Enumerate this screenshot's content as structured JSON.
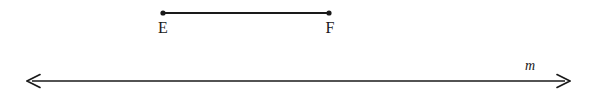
{
  "figure": {
    "background_color": "#ffffff",
    "stroke_color": "#1a1a1a",
    "width": 589,
    "height": 99
  },
  "segment": {
    "name": "segment-ef",
    "endpoint_start_label": "E",
    "endpoint_end_label": "F",
    "x1": 163,
    "x2": 329,
    "y": 13,
    "stroke_width": 2.2,
    "dot_radius": 2.6,
    "label_y": 33,
    "label_e_x": 163,
    "label_f_x": 330
  },
  "line": {
    "name": "line-m",
    "label": "m",
    "x1": 27,
    "x2": 570,
    "y": 81,
    "stroke_width": 1.5,
    "arrow_size": 9,
    "label_x": 530,
    "label_y": 70
  }
}
